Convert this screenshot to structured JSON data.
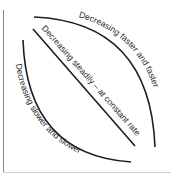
{
  "diagram": {
    "curves": [
      {
        "id": "convex",
        "label": "Decreasing faster and faster"
      },
      {
        "id": "linear",
        "label": "Decreasing steadily – at constant rate"
      },
      {
        "id": "concave",
        "label": "Decreasing slower and slower"
      }
    ],
    "colors": {
      "line": "#1e1e1e",
      "axis": "#8a8a8a",
      "text": "#2a2a2a"
    }
  }
}
